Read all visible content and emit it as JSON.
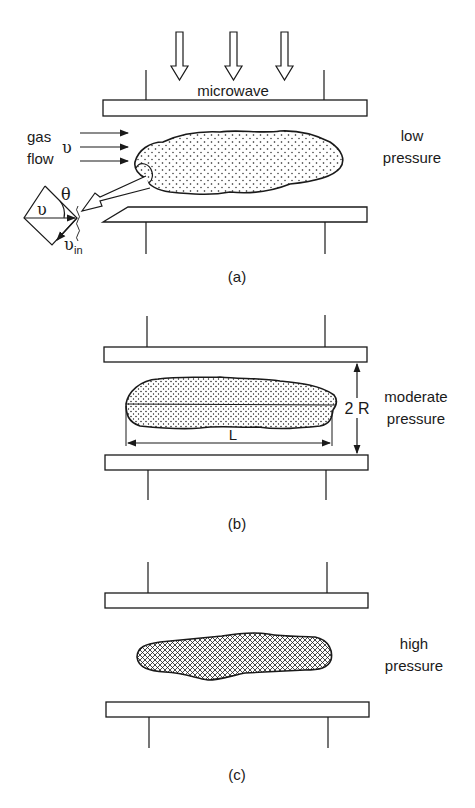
{
  "figure": {
    "panels": [
      {
        "id": "a",
        "caption": "(a)",
        "condition_line1": "low",
        "condition_line2": "pressure",
        "source_label": "microwave",
        "flow_label_line1": "gas",
        "flow_label_line2": "flow",
        "velocity_symbol": "υ",
        "angle_symbol": "θ",
        "inward_velocity_symbol": "υ",
        "inward_velocity_subscript": "in",
        "plasma_fill": "dotted"
      },
      {
        "id": "b",
        "caption": "(b)",
        "condition_line1": "moderate",
        "condition_line2": "pressure",
        "length_label": "L",
        "gap_label": "2 R",
        "plasma_fill": "dotted"
      },
      {
        "id": "c",
        "caption": "(c)",
        "condition_line1": "high",
        "condition_line2": "pressure",
        "plasma_fill": "cross-hatched"
      }
    ],
    "colors": {
      "ink": "#1a1a1a",
      "background": "#ffffff"
    }
  }
}
